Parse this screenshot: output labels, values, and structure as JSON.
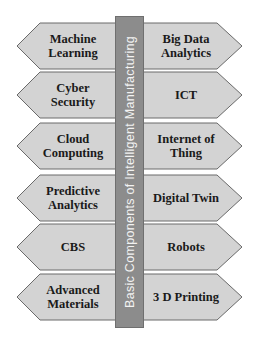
{
  "title": "Basic Components of Intelligent Manufacturing",
  "colors": {
    "arrow_fill": "#d3d3d3",
    "arrow_stroke": "#6a6a6a",
    "bar_fill": "#8c8c8c",
    "bar_text": "#f2f2f2"
  },
  "rows": [
    {
      "left": "Machine\nLearning",
      "right": "Big Data\nAnalytics"
    },
    {
      "left": "Cyber\nSecurity",
      "right": "ICT"
    },
    {
      "left": "Cloud\nComputing",
      "right": "Internet of\nThing"
    },
    {
      "left": "Predictive\nAnalytics",
      "right": "Digital Twin"
    },
    {
      "left": "CBS",
      "right": "Robots"
    },
    {
      "left": "Advanced\nMaterials",
      "right": "3 D Printing"
    }
  ]
}
